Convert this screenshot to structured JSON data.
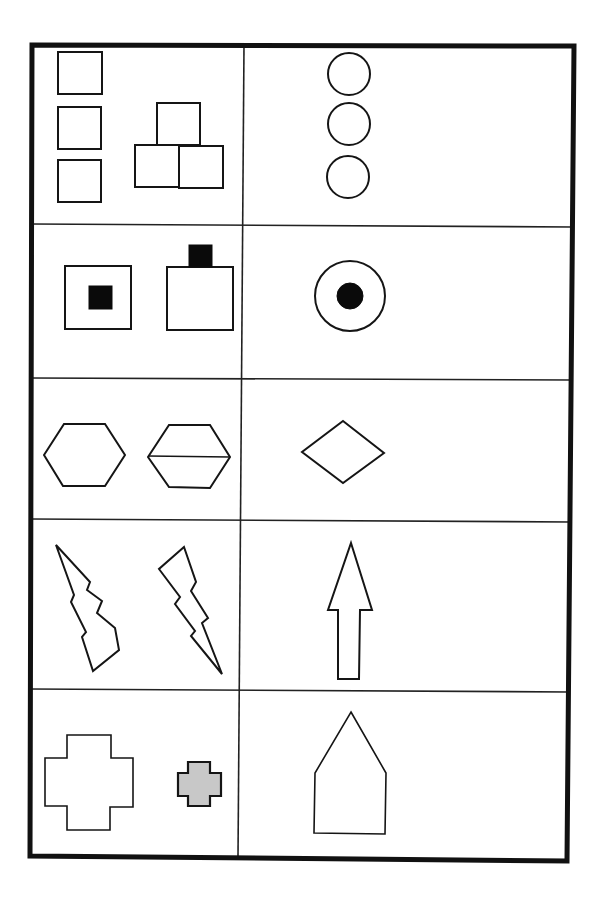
{
  "worksheet": {
    "title": "",
    "frame": {
      "points": [
        [
          32,
          45
        ],
        [
          574,
          46
        ],
        [
          567,
          861
        ],
        [
          30,
          856
        ]
      ],
      "stroke_color": "#111111"
    },
    "column_divider": [
      [
        244,
        45
      ],
      [
        238,
        858
      ]
    ],
    "row_dividers": [
      [
        [
          32,
          224
        ],
        [
          573,
          227
        ]
      ],
      [
        [
          31,
          378
        ],
        [
          572,
          380
        ]
      ],
      [
        [
          31,
          519
        ],
        [
          571,
          522
        ]
      ],
      [
        [
          30,
          689
        ],
        [
          569,
          692
        ]
      ]
    ],
    "colors": {
      "ink": "#151515",
      "solid_fill": "#0a0a0a",
      "gray_fill": "#c8c8c8",
      "background": "#ffffff"
    },
    "rows": [
      {
        "id": "row-1",
        "left_label": "three stacked squares and pyramid of three squares",
        "right_label": "three stacked circles",
        "left": {
          "rects": [
            {
              "x": 58,
              "y": 52,
              "w": 44,
              "h": 42,
              "cls": "shape"
            },
            {
              "x": 58,
              "y": 107,
              "w": 43,
              "h": 42,
              "cls": "shape"
            },
            {
              "x": 58,
              "y": 160,
              "w": 43,
              "h": 42,
              "cls": "shape"
            },
            {
              "x": 157,
              "y": 103,
              "w": 43,
              "h": 42,
              "cls": "shape"
            },
            {
              "x": 135,
              "y": 145,
              "w": 44,
              "h": 42,
              "cls": "shape"
            },
            {
              "x": 179,
              "y": 146,
              "w": 44,
              "h": 42,
              "cls": "shape"
            }
          ]
        },
        "right": {
          "circles": [
            {
              "cx": 349,
              "cy": 74,
              "r": 21,
              "cls": "shape"
            },
            {
              "cx": 349,
              "cy": 124,
              "r": 21,
              "cls": "shape"
            },
            {
              "cx": 348,
              "cy": 177,
              "r": 21,
              "cls": "shape"
            }
          ]
        }
      },
      {
        "id": "row-2",
        "left_label": "square with inner black square, square with black square on top",
        "right_label": "circle with inner black dot",
        "left": {
          "rects": [
            {
              "x": 65,
              "y": 266,
              "w": 66,
              "h": 63,
              "cls": "shape"
            },
            {
              "x": 89,
              "y": 286,
              "w": 23,
              "h": 23,
              "cls": "solid"
            },
            {
              "x": 167,
              "y": 267,
              "w": 66,
              "h": 63,
              "cls": "shape"
            },
            {
              "x": 189,
              "y": 245,
              "w": 23,
              "h": 22,
              "cls": "solid"
            }
          ]
        },
        "right": {
          "circles": [
            {
              "cx": 350,
              "cy": 296,
              "r": 35,
              "cls": "shape"
            },
            {
              "cx": 350,
              "cy": 296,
              "r": 13,
              "cls": "solid"
            }
          ]
        }
      },
      {
        "id": "row-3",
        "left_label": "hexagon, hexagon split horizontally",
        "right_label": "diamond",
        "left": {
          "polygons": [
            {
              "points": "44,455 64,424 105,424 125,455 105,486 63,486",
              "cls": "shape"
            },
            {
              "points": "148,457 169,425 210,425 230,457 210,488 169,487",
              "cls": "shape"
            }
          ],
          "lines": [
            {
              "x1": 148,
              "y1": 456,
              "x2": 230,
              "y2": 457,
              "cls": "line"
            }
          ]
        },
        "right": {
          "polygons": [
            {
              "points": "343,421 384,453 343,483 302,452",
              "cls": "shape"
            }
          ]
        }
      },
      {
        "id": "row-4",
        "left_label": "lightning bolt pointing up-left, lightning bolt pointing down-right",
        "right_label": "upward arrow",
        "left": {
          "polygons": [
            {
              "points": "56,545 90,582 87,590 102,601 97,613 115,628 119,650 93,671 82,637 86,632 71,602 74,595 56,545",
              "cls": "shape"
            },
            {
              "points": "184,547 196,582 191,591 208,618 202,623 222,674 191,636 195,631 175,604 180,597 159,569",
              "cls": "shape"
            }
          ]
        },
        "right": {
          "polygons": [
            {
              "points": "351,543 372,610 360,610 359,679 338,679 338,610 328,610",
              "cls": "shape"
            }
          ]
        }
      },
      {
        "id": "row-5",
        "left_label": "large white cross, small gray cross",
        "right_label": "pentagon house shape",
        "left": {
          "polygons": [
            {
              "points": "67,735 111,735 111,758 133,758 133,807 110,807 110,830 67,830 67,806 45,806 45,758 67,758",
              "cls": "shape-thin"
            },
            {
              "points": "188,762 210,762 210,773 221,773 221,796 210,796 210,806 188,806 188,796 178,796 178,773 188,773",
              "cls": "gray"
            }
          ]
        },
        "right": {
          "polygons": [
            {
              "points": "351,712 386,773 385,834 314,833 315,773",
              "cls": "shape-thin"
            }
          ]
        }
      }
    ]
  }
}
